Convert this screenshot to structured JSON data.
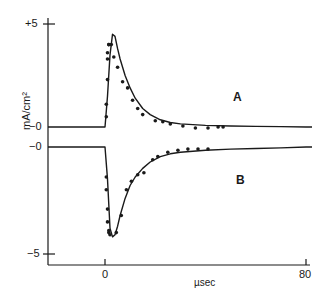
{
  "chart_data": {
    "type": "line",
    "title": "",
    "xlabel": "µsec",
    "ylabel": "mA/cm²",
    "xlim": [
      -22,
      82
    ],
    "x_ticks": [
      {
        "value": 0,
        "label": "0"
      },
      {
        "value": 80,
        "label": "80"
      }
    ],
    "y_ticks": [
      {
        "label": "+5",
        "panel": "A",
        "value": 5
      },
      {
        "label": "−0",
        "panel": "A",
        "value": 0
      },
      {
        "label": "−0",
        "panel": "B",
        "value": 0
      },
      {
        "label": "−5",
        "panel": "B",
        "value": -5
      }
    ],
    "grid": false,
    "legend": "none (curves labeled inline)",
    "series": [
      {
        "name": "A",
        "kind": "theory curve (solid) + experimental points (dots)",
        "curve": {
          "x": [
            -22,
            0,
            1,
            2,
            3,
            4,
            5,
            6,
            8,
            10,
            12,
            15,
            18,
            22,
            26,
            30,
            40,
            50,
            60,
            70,
            80
          ],
          "y": [
            0,
            0,
            1.5,
            3.5,
            4.5,
            4.4,
            3.8,
            3.3,
            2.5,
            1.9,
            1.4,
            0.9,
            0.6,
            0.35,
            0.22,
            0.15,
            0.08,
            0.05,
            0.03,
            0.02,
            0.0
          ]
        },
        "points": {
          "x": [
            0.5,
            0.5,
            1.0,
            1.0,
            1.0,
            1.5,
            1.5,
            2.5,
            3.5,
            5,
            7,
            9,
            11,
            13,
            15,
            20,
            23,
            26,
            31,
            36,
            41,
            45,
            47
          ],
          "y": [
            0.5,
            1.1,
            2.3,
            3.3,
            3.6,
            4.0,
            4.0,
            4.0,
            3.4,
            2.9,
            2.2,
            1.9,
            1.3,
            0.9,
            0.6,
            0.3,
            0.25,
            0.15,
            0.05,
            -0.05,
            -0.05,
            0.0,
            0.0
          ]
        }
      },
      {
        "name": "B",
        "kind": "theory curve (solid) + experimental points (dots)",
        "curve": {
          "x": [
            -22,
            0,
            1,
            2,
            3,
            4,
            5,
            6,
            8,
            10,
            12,
            15,
            18,
            22,
            26,
            30,
            40,
            50,
            60,
            70,
            80
          ],
          "y": [
            0,
            0,
            -1.5,
            -3.8,
            -4.2,
            -4.1,
            -3.7,
            -3.2,
            -2.4,
            -1.8,
            -1.4,
            -1.0,
            -0.7,
            -0.45,
            -0.32,
            -0.25,
            -0.15,
            -0.1,
            -0.07,
            -0.04,
            0.0
          ]
        },
        "points": {
          "x": [
            0.5,
            0.5,
            1.0,
            1.0,
            1.5,
            1.5,
            2.0,
            4.5,
            6.5,
            8.5,
            10.5,
            13,
            15.5,
            19,
            21,
            25,
            29,
            33,
            37,
            41
          ],
          "y": [
            -1.4,
            -2.0,
            -2.9,
            -3.5,
            -3.9,
            -4.0,
            -4.1,
            -4.0,
            -3.2,
            -2.0,
            -1.6,
            -1.3,
            -1.2,
            -0.6,
            -0.45,
            -0.25,
            -0.15,
            -0.1,
            -0.1,
            -0.1
          ]
        }
      }
    ],
    "annotations": [
      {
        "text": "A",
        "near": "upper curve, right side"
      },
      {
        "text": "B",
        "near": "lower curve, right side"
      }
    ]
  },
  "labels": {
    "y_axis_title": "mA/cm²",
    "x_axis_title": "µsec",
    "tick_plus5": "+5",
    "tick_zero_a": "−0",
    "tick_zero_b": "−0",
    "tick_minus5": "−5",
    "tick_x0": "0",
    "tick_x80": "80",
    "label_a": "A",
    "label_b": "B"
  },
  "colors": {
    "ink": "#1a1a1a",
    "background": "#ffffff"
  }
}
